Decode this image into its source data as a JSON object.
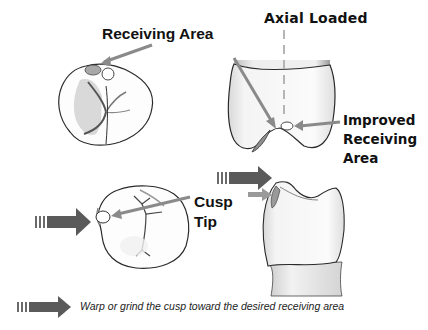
{
  "labels": {
    "receiving_area": "Receiving Area",
    "axial_loaded": "Axial Loaded",
    "improved_receiving_area_line1": "Improved",
    "improved_receiving_area_line2": "Receiving",
    "improved_receiving_area_line3": "Area",
    "cusp_tip_line1": "Cusp",
    "cusp_tip_line2": "Tip"
  },
  "legend": {
    "icon": "striped-block-arrow-icon",
    "text": "Warp or grind the cusp toward the desired receiving area"
  },
  "figures": [
    {
      "name": "occlusal-view-tooth-top-left",
      "marks": [
        "receiving-area-ellipse-shaded",
        "cusp-contact-circle"
      ]
    },
    {
      "name": "lateral-view-tooth-top-right",
      "marks": [
        "axial-load-dashed-line",
        "improved-receiving-area-ellipse"
      ]
    },
    {
      "name": "occlusal-view-tooth-bottom-left",
      "marks": [
        "cusp-tip-ellipse",
        "push-arrow"
      ]
    },
    {
      "name": "lateral-view-tooth-bottom-right",
      "marks": [
        "shaded-cusp-facet",
        "push-arrow",
        "small-arrow"
      ]
    }
  ],
  "colors": {
    "arrow_gray": "#8a8a8a",
    "block_arrow_dark": "#555555",
    "outline": "#2a2a2a",
    "shading": "#bdbdbd",
    "text": "#111111"
  }
}
